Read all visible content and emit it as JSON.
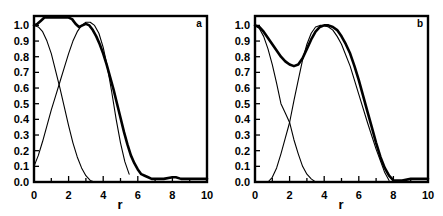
{
  "figure": {
    "background_color": "#ffffff",
    "line_color": "#000000",
    "panel_count": 2
  },
  "panels": [
    {
      "tag": "a",
      "xlabel": "r",
      "ylabel": "",
      "xticklabels": [
        "0",
        "2",
        "4",
        "6",
        "8",
        "10"
      ],
      "yticklabels": [
        "0.0",
        "0.1",
        "0.2",
        "0.3",
        "0.4",
        "0.5",
        "0.6",
        "0.7",
        "0.8",
        "0.9",
        "1.0"
      ]
    },
    {
      "tag": "b",
      "xlabel": "r",
      "ylabel": "",
      "xticklabels": [
        "0",
        "2",
        "4",
        "6",
        "8",
        "10"
      ],
      "yticklabels": [
        "0.0",
        "0.1",
        "0.2",
        "0.3",
        "0.4",
        "0.5",
        "0.6",
        "0.7",
        "0.8",
        "0.9",
        "1.0"
      ]
    }
  ],
  "chart_data": [
    {
      "type": "line",
      "title": "a",
      "xlabel": "r",
      "ylabel": "",
      "xlim": [
        0,
        10
      ],
      "ylim": [
        0.0,
        1.0
      ],
      "xticks": [
        0,
        2,
        4,
        6,
        8,
        10
      ],
      "yticks": [
        0.0,
        0.1,
        0.2,
        0.3,
        0.4,
        0.5,
        0.6,
        0.7,
        0.8,
        0.9,
        1.0
      ],
      "grid": false,
      "legend": null,
      "annotations": [
        "a"
      ],
      "series": [
        {
          "name": "total",
          "style": "thick-noisy",
          "x": [
            0.0,
            0.2,
            0.4,
            0.6,
            0.8,
            1.0,
            1.2,
            1.4,
            1.6,
            1.8,
            2.0,
            2.2,
            2.4,
            2.6,
            2.8,
            3.0,
            3.2,
            3.4,
            3.6,
            3.8,
            4.0,
            4.2,
            4.4,
            4.6,
            4.8,
            5.0,
            5.2,
            5.4,
            5.6,
            5.8,
            6.0,
            6.2,
            6.4,
            6.6,
            6.8,
            7.0,
            7.5,
            8.0,
            8.2,
            8.5,
            9.0,
            9.5,
            10.0
          ],
          "values": [
            1.0,
            1.01,
            1.03,
            1.05,
            1.05,
            1.05,
            1.05,
            1.05,
            1.05,
            1.05,
            1.05,
            1.04,
            1.01,
            0.99,
            1.0,
            1.01,
            1.0,
            0.97,
            0.93,
            0.88,
            0.82,
            0.75,
            0.67,
            0.59,
            0.5,
            0.41,
            0.32,
            0.24,
            0.17,
            0.12,
            0.08,
            0.05,
            0.04,
            0.03,
            0.02,
            0.02,
            0.02,
            0.03,
            0.03,
            0.02,
            0.02,
            0.02,
            0.02
          ]
        },
        {
          "name": "component-1",
          "style": "thin-smooth",
          "x": [
            0.0,
            0.25,
            0.5,
            0.75,
            1.0,
            1.25,
            1.5,
            1.75,
            2.0,
            2.25,
            2.5,
            2.75,
            3.0,
            3.25,
            3.5,
            3.75,
            4.0
          ],
          "values": [
            1.0,
            0.99,
            0.96,
            0.9,
            0.82,
            0.71,
            0.6,
            0.48,
            0.36,
            0.25,
            0.16,
            0.09,
            0.04,
            0.01,
            0.0,
            0.0,
            0.0
          ]
        },
        {
          "name": "component-2",
          "style": "thin-smooth",
          "x": [
            0.0,
            0.25,
            0.5,
            0.75,
            1.0,
            1.25,
            1.5,
            1.75,
            2.0,
            2.25,
            2.5,
            2.75,
            3.0,
            3.25,
            3.5,
            3.75,
            4.0,
            4.25,
            4.5,
            4.75,
            5.0,
            5.25,
            5.5
          ],
          "values": [
            0.1,
            0.17,
            0.26,
            0.36,
            0.46,
            0.55,
            0.64,
            0.73,
            0.82,
            0.9,
            0.96,
            1.0,
            1.02,
            1.02,
            1.0,
            0.95,
            0.86,
            0.73,
            0.57,
            0.4,
            0.25,
            0.13,
            0.05
          ]
        }
      ]
    },
    {
      "type": "line",
      "title": "b",
      "xlabel": "r",
      "ylabel": "",
      "xlim": [
        0,
        10
      ],
      "ylim": [
        0.0,
        1.0
      ],
      "xticks": [
        0,
        2,
        4,
        6,
        8,
        10
      ],
      "yticks": [
        0.0,
        0.1,
        0.2,
        0.3,
        0.4,
        0.5,
        0.6,
        0.7,
        0.8,
        0.9,
        1.0
      ],
      "grid": false,
      "legend": null,
      "annotations": [
        "b"
      ],
      "series": [
        {
          "name": "total",
          "style": "thick-noisy",
          "x": [
            0.0,
            0.25,
            0.5,
            0.75,
            1.0,
            1.25,
            1.5,
            1.75,
            2.0,
            2.25,
            2.5,
            2.75,
            3.0,
            3.25,
            3.5,
            3.75,
            4.0,
            4.25,
            4.5,
            4.75,
            5.0,
            5.25,
            5.5,
            5.75,
            6.0,
            6.25,
            6.5,
            6.75,
            7.0,
            7.25,
            7.5,
            7.75,
            8.0,
            8.5,
            9.0,
            9.5,
            10.0
          ],
          "values": [
            1.0,
            0.99,
            0.96,
            0.92,
            0.88,
            0.84,
            0.8,
            0.77,
            0.75,
            0.74,
            0.75,
            0.79,
            0.85,
            0.91,
            0.96,
            0.99,
            1.0,
            1.0,
            0.99,
            0.97,
            0.93,
            0.88,
            0.82,
            0.74,
            0.65,
            0.55,
            0.45,
            0.35,
            0.25,
            0.16,
            0.09,
            0.04,
            0.01,
            0.01,
            0.02,
            0.02,
            0.02
          ]
        },
        {
          "name": "component-1",
          "style": "thin-smooth",
          "x": [
            0.0,
            0.25,
            0.5,
            0.75,
            1.0,
            1.25,
            1.5,
            1.75,
            2.0,
            2.25,
            2.5,
            2.75,
            3.0,
            3.25,
            3.5,
            3.75
          ],
          "values": [
            1.0,
            0.98,
            0.93,
            0.85,
            0.75,
            0.63,
            0.5,
            0.44,
            0.38,
            0.27,
            0.18,
            0.1,
            0.05,
            0.02,
            0.0,
            0.0
          ]
        },
        {
          "name": "component-2",
          "style": "thin-smooth",
          "x": [
            0.75,
            1.0,
            1.25,
            1.5,
            1.75,
            2.0,
            2.25,
            2.5,
            2.75,
            3.0,
            3.25,
            3.5,
            3.75,
            4.0,
            4.25,
            4.5,
            4.75,
            5.0,
            5.5,
            6.0,
            6.5,
            7.0,
            7.5,
            7.75
          ],
          "values": [
            0.0,
            0.03,
            0.09,
            0.18,
            0.28,
            0.38,
            0.52,
            0.65,
            0.78,
            0.88,
            0.95,
            0.99,
            1.0,
            1.0,
            0.99,
            0.97,
            0.93,
            0.88,
            0.74,
            0.56,
            0.38,
            0.21,
            0.06,
            0.01
          ]
        }
      ]
    }
  ]
}
